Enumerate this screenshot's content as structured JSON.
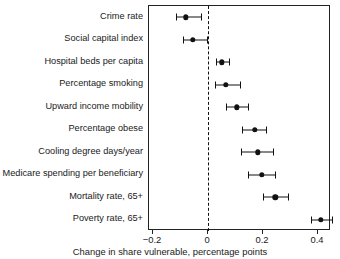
{
  "chart_data": {
    "type": "scatter",
    "subtype": "dot-and-whisker coefficient plot",
    "title": "",
    "xlabel": "Change in share vulnerable, percentage points",
    "ylabel": "",
    "xlim": [
      -0.26,
      0.45
    ],
    "xticks": [
      -0.2,
      0,
      0.2,
      0.4
    ],
    "xticklabels": [
      "−0.2",
      "0",
      "0.2",
      "0.4"
    ],
    "grid": false,
    "legend": null,
    "reference_line": {
      "x": 0,
      "style": "dashed",
      "color": "#111111"
    },
    "marker": {
      "shape": "circle",
      "color": "#111111",
      "errorbar_caps": true
    },
    "categories": [
      "Crime rate",
      "Social capital index",
      "Hospital beds per capita",
      "Percentage smoking",
      "Upward income mobility",
      "Percentage obese",
      "Cooling degree days/year",
      "Medicare spending per beneficiary",
      "Mortality rate, 65+",
      "Poverty rate, 65+"
    ],
    "values": [
      -0.08,
      -0.055,
      0.05,
      0.065,
      0.105,
      0.17,
      0.18,
      0.195,
      0.245,
      0.41
    ],
    "ci_low": [
      -0.115,
      -0.09,
      0.03,
      0.025,
      0.065,
      0.125,
      0.12,
      0.145,
      0.2,
      0.375
    ],
    "ci_high": [
      -0.025,
      -0.005,
      0.075,
      0.115,
      0.145,
      0.21,
      0.235,
      0.245,
      0.29,
      0.45
    ],
    "points": [
      {
        "label": "Crime rate",
        "value": -0.08,
        "ci_low": -0.115,
        "ci_high": -0.025
      },
      {
        "label": "Social capital index",
        "value": -0.055,
        "ci_low": -0.09,
        "ci_high": -0.005
      },
      {
        "label": "Hospital beds per capita",
        "value": 0.05,
        "ci_low": 0.03,
        "ci_high": 0.075
      },
      {
        "label": "Percentage smoking",
        "value": 0.065,
        "ci_low": 0.025,
        "ci_high": 0.115
      },
      {
        "label": "Upward income mobility",
        "value": 0.105,
        "ci_low": 0.065,
        "ci_high": 0.145
      },
      {
        "label": "Percentage obese",
        "value": 0.17,
        "ci_low": 0.125,
        "ci_high": 0.21
      },
      {
        "label": "Cooling degree days/year",
        "value": 0.18,
        "ci_low": 0.12,
        "ci_high": 0.235
      },
      {
        "label": "Medicare spending per beneficiary",
        "value": 0.195,
        "ci_low": 0.145,
        "ci_high": 0.245
      },
      {
        "label": "Mortality rate, 65+",
        "value": 0.245,
        "ci_low": 0.2,
        "ci_high": 0.29
      },
      {
        "label": "Poverty rate, 65+",
        "value": 0.41,
        "ci_low": 0.375,
        "ci_high": 0.45
      }
    ]
  }
}
